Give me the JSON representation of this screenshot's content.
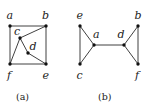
{
  "figure": {
    "panels": [
      {
        "caption": "(a)",
        "nodes": [
          {
            "id": "a",
            "label": "a"
          },
          {
            "id": "b",
            "label": "b"
          },
          {
            "id": "c",
            "label": "c"
          },
          {
            "id": "d",
            "label": "d"
          },
          {
            "id": "e",
            "label": "e"
          },
          {
            "id": "f",
            "label": "f"
          }
        ],
        "edges": [
          [
            "a",
            "b"
          ],
          [
            "a",
            "f"
          ],
          [
            "b",
            "e"
          ],
          [
            "f",
            "e"
          ],
          [
            "c",
            "b"
          ],
          [
            "c",
            "f"
          ],
          [
            "c",
            "d"
          ],
          [
            "d",
            "e"
          ]
        ]
      },
      {
        "caption": "(b)",
        "nodes": [
          {
            "id": "e",
            "label": "e"
          },
          {
            "id": "a",
            "label": "a"
          },
          {
            "id": "c",
            "label": "c"
          },
          {
            "id": "d",
            "label": "d"
          },
          {
            "id": "b",
            "label": "b"
          },
          {
            "id": "f",
            "label": "f"
          }
        ],
        "edges": [
          [
            "e",
            "a"
          ],
          [
            "e",
            "c"
          ],
          [
            "a",
            "c"
          ],
          [
            "a",
            "d"
          ],
          [
            "d",
            "b"
          ],
          [
            "d",
            "f"
          ],
          [
            "b",
            "f"
          ]
        ]
      }
    ]
  }
}
